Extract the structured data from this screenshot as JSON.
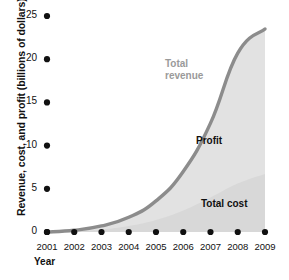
{
  "chart_data": {
    "type": "area",
    "title": "",
    "xlabel": "Year",
    "ylabel": "Revenue, cost, and profit (billions of dollars)",
    "categories": [
      "2001",
      "2002",
      "2003",
      "2004",
      "2005",
      "2006",
      "2007",
      "2008",
      "2009"
    ],
    "x": [
      2001,
      2002,
      2003,
      2004,
      2005,
      2006,
      2007,
      2008,
      2009
    ],
    "xlim": [
      2001,
      2009
    ],
    "ylim": [
      0,
      25
    ],
    "yticks": [
      0,
      5,
      10,
      15,
      20,
      25
    ],
    "ytick_labels": [
      "0",
      "5",
      "10",
      "15",
      "20",
      "25"
    ],
    "grid": false,
    "legend_position": "inline-annotations",
    "series": [
      {
        "name": "Total revenue",
        "values": [
          0.0,
          0.2,
          0.7,
          1.7,
          3.6,
          7.0,
          12.6,
          20.7,
          23.5
        ],
        "color": "#8c8c8c"
      },
      {
        "name": "Total cost",
        "values": [
          0.0,
          0.1,
          0.3,
          0.7,
          1.4,
          2.5,
          4.0,
          5.6,
          6.7
        ],
        "color": "#d6d6d6"
      },
      {
        "name": "Profit",
        "values": [
          0.0,
          0.1,
          0.4,
          1.0,
          2.2,
          4.5,
          8.6,
          15.1,
          16.8
        ],
        "color": "#e2e2e2"
      }
    ],
    "annotations": [
      {
        "text": "Total revenue",
        "line1": "Total",
        "line2": "revenue",
        "x": 2006,
        "y": 17.5
      },
      {
        "text": "Profit",
        "x": 2007,
        "y": 11.0
      },
      {
        "text": "Total cost",
        "x": 2007,
        "y": 4.0
      }
    ]
  },
  "axes": {
    "y_title": "Revenue, cost, and profit (billions of dollars)",
    "x_title": "Year",
    "y_ticks": [
      "25",
      "20",
      "15",
      "10",
      "5",
      "0"
    ],
    "x_ticks": [
      "2001",
      "2002",
      "2003",
      "2004",
      "2005",
      "2006",
      "2007",
      "2008",
      "2009"
    ]
  },
  "labels": {
    "revenue_line1": "Total",
    "revenue_line2": "revenue",
    "profit": "Profit",
    "cost": "Total cost"
  },
  "colors": {
    "revenue_line": "#8c8c8c",
    "profit_fill": "#e2e2e2",
    "cost_fill": "#d8d8d8",
    "tick_dot": "#111111",
    "text": "#111111",
    "revenue_label": "#9a9a9a"
  }
}
